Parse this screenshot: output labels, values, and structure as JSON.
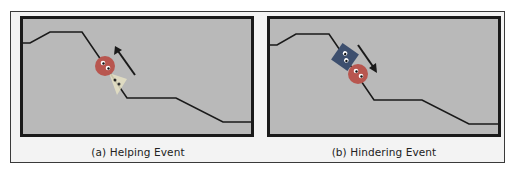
{
  "figure": {
    "panels": [
      {
        "id": "a",
        "caption": "(a) Helping Event",
        "event": "helping",
        "arrow_direction": "up-slope",
        "characters": [
          "red-circle-climber",
          "yellow-triangle-helper"
        ]
      },
      {
        "id": "b",
        "caption": "(b)  Hindering Event",
        "event": "hindering",
        "arrow_direction": "down-slope",
        "characters": [
          "blue-square-hinderer",
          "red-circle-climber"
        ]
      }
    ],
    "colors": {
      "background": "#b9b9b9",
      "border": "#1a1a1a",
      "hill_line": "#1a1a1a",
      "climber": "#b8564f",
      "helper": "#e8e0a8",
      "hinderer": "#3d4f6e",
      "arrow": "#1a1a1a"
    }
  }
}
